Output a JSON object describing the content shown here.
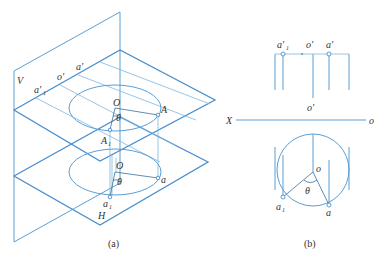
{
  "figure_a": {
    "caption": "(a)",
    "plane_v_label": "V",
    "plane_h_label": "H",
    "labels": {
      "a1_prime": "a'",
      "a1_prime_sub": "1",
      "o_prime": "o'",
      "a_prime": "a'",
      "O_upper": "O",
      "A_upper": "A",
      "theta_upper": "θ",
      "A1_upper": "A",
      "A1_upper_sub": "1",
      "O_lower": "O",
      "theta_lower": "θ",
      "a_lower": "a",
      "a1_lower": "a",
      "a1_lower_sub": "1"
    }
  },
  "figure_b": {
    "caption": "(b)",
    "axis_left": "X",
    "axis_right": "o",
    "labels": {
      "a1_prime": "a'",
      "a1_prime_sub": "1",
      "o_prime_top": "o'",
      "a_prime": "a'",
      "o_prime_bottom": "o'",
      "o_center": "o",
      "theta": "θ",
      "a1": "a",
      "a1_sub": "1",
      "a": "a"
    }
  },
  "colors": {
    "line": "#5a9fd4",
    "text": "#333333"
  }
}
